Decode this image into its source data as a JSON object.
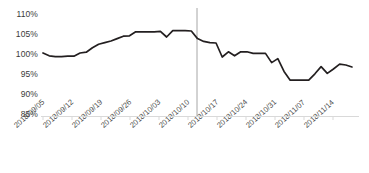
{
  "chart_data": {
    "type": "line",
    "title": "",
    "subtitle": "",
    "xlabel": "",
    "ylabel": "",
    "ylim": [
      85,
      112.5
    ],
    "yticks": [
      110,
      105,
      100,
      95,
      90,
      85
    ],
    "ytick_labels": [
      "110%",
      "105%",
      "100%",
      "95%",
      "90%",
      "85%"
    ],
    "grid": false,
    "legend": null,
    "line_color": "#231f20",
    "axis_color": "#d9d9d9",
    "marker_line_color": "#a6a6a6",
    "categories": [
      "2018/09/05",
      "2018/09/12",
      "2018/09/19",
      "2018/09/26",
      "2018/10/03",
      "2018/10/10",
      "2018/10/17",
      "2018/10/24",
      "2018/10/31",
      "2018/11/07",
      "2018/11/14"
    ],
    "xtick_labels": [
      "2018/09/05",
      "2018/09/12",
      "2018/09/19",
      "2018/09/26",
      "2018/10/03",
      "2018/10/10",
      "2018/10/17",
      "2018/10/24",
      "2018/10/31",
      "2018/11/07",
      "2018/11/14"
    ],
    "annotations": [
      {
        "name": "reference-line",
        "x": "2018/10/10",
        "orientation": "vertical"
      }
    ],
    "series": [
      {
        "name": "index",
        "x": [
          "2018/09/05",
          "2018/09/06",
          "2018/09/07",
          "2018/09/10",
          "2018/09/11",
          "2018/09/12",
          "2018/09/13",
          "2018/09/14",
          "2018/09/17",
          "2018/09/18",
          "2018/09/19",
          "2018/09/20",
          "2018/09/21",
          "2018/09/25",
          "2018/09/26",
          "2018/09/27",
          "2018/09/28",
          "2018/10/01",
          "2018/10/02",
          "2018/10/03",
          "2018/10/04",
          "2018/10/05",
          "2018/10/08",
          "2018/10/09",
          "2018/10/10",
          "2018/10/11",
          "2018/10/12",
          "2018/10/15",
          "2018/10/16",
          "2018/10/17",
          "2018/10/18",
          "2018/10/19",
          "2018/10/22",
          "2018/10/23",
          "2018/10/24",
          "2018/10/25",
          "2018/10/26",
          "2018/10/29",
          "2018/10/30",
          "2018/10/31",
          "2018/11/01",
          "2018/11/02",
          "2018/11/05",
          "2018/11/06",
          "2018/11/07",
          "2018/11/08",
          "2018/11/09",
          "2018/11/12",
          "2018/11/13",
          "2018/11/14",
          "2018/11/15"
        ],
        "values": [
          100.0,
          99.3,
          99.1,
          99.1,
          99.2,
          99.2,
          100.0,
          100.2,
          101.3,
          102.2,
          102.6,
          103.0,
          103.6,
          104.2,
          104.3,
          105.3,
          105.3,
          105.3,
          105.3,
          105.4,
          104.0,
          105.6,
          105.6,
          105.6,
          105.5,
          103.6,
          102.9,
          102.6,
          102.5,
          99.0,
          100.3,
          99.3,
          100.3,
          100.3,
          99.9,
          99.9,
          99.9,
          97.6,
          98.6,
          95.4,
          93.2,
          93.2,
          93.2,
          93.2,
          94.8,
          96.6,
          94.9,
          96.0,
          97.2,
          97.0,
          96.5
        ]
      }
    ]
  }
}
